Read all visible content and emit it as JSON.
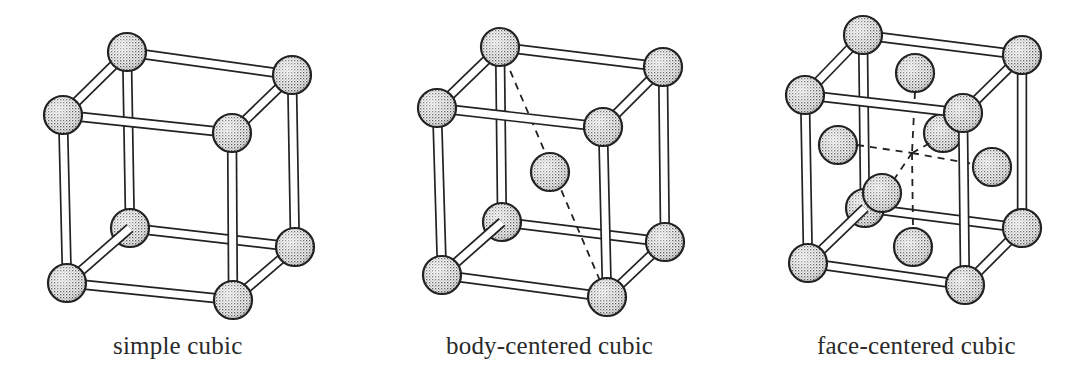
{
  "figure": {
    "background": "#ffffff",
    "stroke_color": "#222222",
    "atom_fill_pattern": "stipple",
    "atom_fill_color": "#d9d9d9",
    "atom_radius": 19,
    "rod_width": 8,
    "dash_pattern": "7,6"
  },
  "structures": [
    {
      "id": "simple-cubic",
      "label": "simple cubic",
      "corners": {
        "btl": [
          127,
          52
        ],
        "btr": [
          292,
          75
        ],
        "ftl": [
          63,
          115
        ],
        "ftr": [
          232,
          133
        ],
        "bbl": [
          130,
          228
        ],
        "bbr": [
          295,
          247
        ],
        "fbl": [
          67,
          283
        ],
        "fbr": [
          233,
          300
        ]
      },
      "extra_atoms": [],
      "dashed_lines": []
    },
    {
      "id": "body-centered-cubic",
      "label": "body-centered cubic",
      "corners": {
        "btl": [
          500,
          47
        ],
        "btr": [
          663,
          67
        ],
        "ftl": [
          437,
          108
        ],
        "ftr": [
          603,
          127
        ],
        "bbl": [
          502,
          222
        ],
        "bbr": [
          665,
          242
        ],
        "fbl": [
          442,
          275
        ],
        "fbr": [
          607,
          297
        ]
      },
      "extra_atoms": [
        {
          "name": "body-center-atom",
          "pos": [
            550,
            172
          ]
        }
      ],
      "dashed_lines": [
        {
          "from": [
            500,
            47
          ],
          "to": [
            607,
            297
          ]
        }
      ]
    },
    {
      "id": "face-centered-cubic",
      "label": "face-centered cubic",
      "corners": {
        "btl": [
          863,
          35
        ],
        "btr": [
          1022,
          55
        ],
        "ftl": [
          805,
          95
        ],
        "ftr": [
          963,
          113
        ],
        "bbl": [
          865,
          208
        ],
        "bbr": [
          1022,
          228
        ],
        "fbl": [
          808,
          263
        ],
        "fbr": [
          965,
          285
        ]
      },
      "extra_atoms": [
        {
          "name": "back-face-atom",
          "pos": [
            943,
            133
          ],
          "layer": "back"
        },
        {
          "name": "top-face-atom",
          "pos": [
            915,
            73
          ],
          "layer": "back"
        },
        {
          "name": "bottom-face-atom",
          "pos": [
            913,
            247
          ],
          "layer": "back"
        },
        {
          "name": "left-face-atom",
          "pos": [
            838,
            145
          ],
          "layer": "front"
        },
        {
          "name": "right-face-atom",
          "pos": [
            992,
            167
          ],
          "layer": "front"
        },
        {
          "name": "front-face-atom",
          "pos": [
            882,
            193
          ],
          "layer": "front"
        }
      ],
      "dashed_lines": [
        {
          "from": [
            915,
            92
          ],
          "to": [
            912,
            153
          ]
        },
        {
          "from": [
            912,
            153
          ],
          "to": [
            913,
            228
          ]
        },
        {
          "from": [
            857,
            145
          ],
          "to": [
            912,
            153
          ]
        },
        {
          "from": [
            912,
            153
          ],
          "to": [
            973,
            164
          ]
        },
        {
          "from": [
            912,
            153
          ],
          "to": [
            895,
            178
          ]
        },
        {
          "from": [
            912,
            153
          ],
          "to": [
            930,
            143
          ]
        }
      ]
    }
  ]
}
